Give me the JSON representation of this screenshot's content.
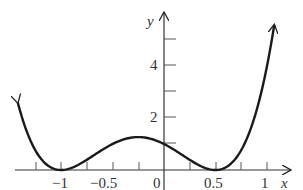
{
  "chart_data": {
    "type": "line",
    "title": "",
    "xlabel": "x",
    "ylabel": "y",
    "function": "y = (2x^2 + x - 1)^2 = 4(x+1)^2(x-0.5)^2",
    "xlim": [
      -1.42,
      1.07
    ],
    "ylim": [
      0,
      6
    ],
    "x_ticks": [
      -1.25,
      -1,
      -0.75,
      -0.5,
      -0.25,
      0,
      0.25,
      0.5,
      0.75,
      1
    ],
    "x_tick_labels": [
      {
        "value": -1,
        "label": "−1"
      },
      {
        "value": -0.5,
        "label": "−0.5"
      },
      {
        "value": 0,
        "label": "0"
      },
      {
        "value": 0.5,
        "label": "0.5"
      },
      {
        "value": 1,
        "label": "1"
      }
    ],
    "y_ticks": [
      1,
      2,
      3,
      4,
      5
    ],
    "y_tick_labels": [
      {
        "value": 2,
        "label": "2"
      },
      {
        "value": 4,
        "label": "4"
      }
    ],
    "key_points": [
      {
        "x": -1,
        "y": 0,
        "note": "local minimum (root)"
      },
      {
        "x": -0.25,
        "y": 1.27,
        "note": "local maximum"
      },
      {
        "x": 0,
        "y": 1,
        "note": "y-intercept"
      },
      {
        "x": 0.5,
        "y": 0,
        "note": "local minimum (root)"
      }
    ],
    "series": [
      {
        "name": "curve",
        "x": [
          -1.42,
          -1.25,
          -1.0,
          -0.75,
          -0.5,
          -0.25,
          0.0,
          0.25,
          0.5,
          0.75,
          1.0,
          1.07
        ],
        "y": [
          2.6,
          0.56,
          0.0,
          0.39,
          1.0,
          1.27,
          1.0,
          0.39,
          0.0,
          0.77,
          4.0,
          5.57
        ]
      }
    ],
    "grid": false,
    "legend": null,
    "arrows": {
      "curve_ends": true,
      "x_axis": true,
      "y_axis": true
    }
  },
  "labels": {
    "x_axis": "x",
    "y_axis": "y",
    "x_neg1": "−1",
    "x_neg05": "−0.5",
    "x_0": "0",
    "x_05": "0.5",
    "x_1": "1",
    "y_2": "2",
    "y_4": "4"
  }
}
